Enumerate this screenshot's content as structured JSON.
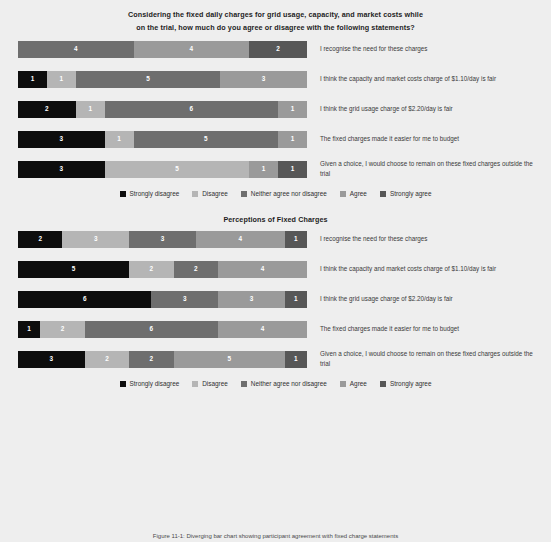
{
  "figure": {
    "question_line1": "Considering the fixed daily charges for grid usage, capacity, and market costs while",
    "question_line2": "on the trial, how much do you agree or disagree with the following statements?",
    "chart2_title": "Perceptions of Fixed Charges",
    "caption": "Figure 11-1: Diverging bar chart showing participant agreement with fixed charge statements"
  },
  "colors": {
    "strongly_disagree": "#0d0d0d",
    "disagree": "#b5b5b5",
    "neither": "#6e6e6e",
    "agree": "#9a9a9a",
    "strongly_agree": "#575757",
    "background": "#eeeeee"
  },
  "legend": {
    "items": [
      {
        "label": "Strongly disagree",
        "color": "#0d0d0d"
      },
      {
        "label": "Disagree",
        "color": "#b5b5b5"
      },
      {
        "label": "Neither agree nor disagree",
        "color": "#6e6e6e"
      },
      {
        "label": "Agree",
        "color": "#9a9a9a"
      },
      {
        "label": "Strongly agree",
        "color": "#575757"
      }
    ]
  },
  "chart_data": [
    {
      "type": "bar",
      "orientation": "horizontal",
      "stacked": true,
      "title": "Considering the fixed daily charges for grid usage, capacity, and market costs while on the trial, how much do you agree or disagree with the following statements?",
      "xlabel": "",
      "ylabel": "",
      "legend_position": "bottom",
      "grid": false,
      "categories": [
        "I recognise the need for these charges",
        "I think the capacity and market costs charge of $1.10/day is fair",
        "I think the grid usage charge of $2.20/day is fair",
        "The fixed charges made it easier for me to budget",
        "Given a choice, I would choose to remain on these fixed charges outside the trial"
      ],
      "series": [
        {
          "name": "Strongly disagree",
          "values": [
            0,
            1,
            2,
            3,
            3
          ]
        },
        {
          "name": "Disagree",
          "values": [
            0,
            1,
            1,
            1,
            5
          ]
        },
        {
          "name": "Neither agree nor disagree",
          "values": [
            4,
            5,
            6,
            5,
            0
          ]
        },
        {
          "name": "Agree",
          "values": [
            4,
            3,
            1,
            1,
            1
          ]
        },
        {
          "name": "Strongly agree",
          "values": [
            2,
            0,
            0,
            0,
            1
          ]
        }
      ],
      "totals": [
        10,
        10,
        10,
        10,
        10
      ]
    },
    {
      "type": "bar",
      "orientation": "horizontal",
      "stacked": true,
      "title": "Perceptions of Fixed Charges",
      "xlabel": "",
      "ylabel": "",
      "legend_position": "bottom",
      "grid": false,
      "categories": [
        "I recognise the need for these charges",
        "I think the capacity and market costs charge of $1.10/day is fair",
        "I think the grid usage charge of $2.20/day is fair",
        "The fixed charges made it easier for me to budget",
        "Given a choice, I would choose to remain on these fixed charges outside the trial"
      ],
      "series": [
        {
          "name": "Strongly disagree",
          "values": [
            2,
            5,
            6,
            1,
            3
          ]
        },
        {
          "name": "Disagree",
          "values": [
            3,
            2,
            0,
            2,
            2
          ]
        },
        {
          "name": "Neither agree nor disagree",
          "values": [
            3,
            2,
            3,
            6,
            2
          ]
        },
        {
          "name": "Agree",
          "values": [
            4,
            4,
            3,
            4,
            5
          ]
        },
        {
          "name": "Strongly agree",
          "values": [
            1,
            0,
            1,
            0,
            1
          ]
        }
      ],
      "totals": [
        13,
        13,
        13,
        13,
        13
      ]
    }
  ]
}
